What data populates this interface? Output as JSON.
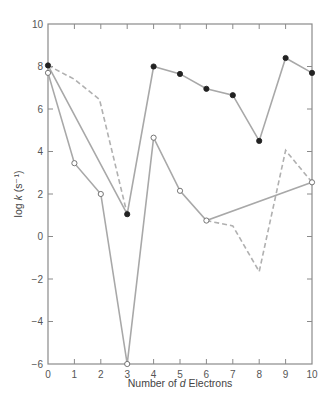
{
  "chart_data": {
    "type": "line",
    "title": "",
    "xlabel": "Number of d Electrons",
    "ylabel": "log k (s⁻¹)",
    "xlim": [
      0,
      10
    ],
    "ylim": [
      -6,
      10
    ],
    "xticks": [
      0,
      1,
      2,
      3,
      4,
      5,
      6,
      7,
      8,
      9,
      10
    ],
    "yticks": [
      -6,
      -4,
      -2,
      0,
      2,
      4,
      6,
      8,
      10
    ],
    "grid": false,
    "legend": null,
    "series": [
      {
        "name": "filled-circles",
        "style": "solid",
        "marker": "filled-circle",
        "color": "#a8a8a8",
        "points": [
          [
            0,
            8.05
          ],
          [
            3,
            1.05
          ],
          [
            4,
            8.0
          ],
          [
            5,
            7.65
          ],
          [
            6,
            6.95
          ],
          [
            7,
            6.65
          ],
          [
            8,
            4.5
          ],
          [
            9,
            8.4
          ],
          [
            10,
            7.7
          ]
        ]
      },
      {
        "name": "open-circles",
        "style": "solid",
        "marker": "open-circle",
        "color": "#a8a8a8",
        "points": [
          [
            0,
            7.7
          ],
          [
            1,
            3.45
          ],
          [
            2,
            2.0
          ],
          [
            3,
            -6.0
          ],
          [
            4,
            4.65
          ],
          [
            5,
            2.15
          ],
          [
            6,
            0.75
          ],
          [
            10,
            2.55
          ]
        ]
      },
      {
        "name": "dashed",
        "style": "dashed",
        "marker": "none",
        "color": "#b0b0b0",
        "points": [
          [
            0,
            8.05
          ],
          [
            1,
            7.4
          ],
          [
            2,
            6.4
          ],
          [
            3,
            1.05
          ],
          [
            4,
            null
          ]
        ],
        "segments": [
          [
            [
              0,
              8.05
            ],
            [
              1,
              7.4
            ],
            [
              1.95,
              6.45
            ],
            [
              3,
              1.05
            ]
          ],
          [
            [
              6,
              0.75
            ],
            [
              7,
              0.5
            ],
            [
              8,
              -1.65
            ],
            [
              9,
              4.05
            ],
            [
              10,
              2.55
            ]
          ]
        ]
      }
    ]
  },
  "axes": {
    "xlabel_prefix": "Number of ",
    "xlabel_italic": "d",
    "xlabel_suffix": " Electrons",
    "ylabel_prefix": "log ",
    "ylabel_italic": "k",
    "ylabel_suffix": " (s⁻¹)"
  }
}
